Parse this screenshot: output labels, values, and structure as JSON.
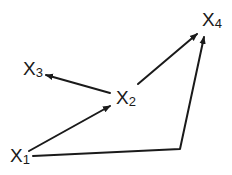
{
  "diagram": {
    "type": "directed-graph",
    "colors": {
      "edge": "#1a1a1a",
      "label": "#1a1a1a",
      "background": "#ffffff"
    },
    "nodes": [
      {
        "id": "x1",
        "base": "X",
        "sub": "1"
      },
      {
        "id": "x2",
        "base": "X",
        "sub": "2"
      },
      {
        "id": "x3",
        "base": "X",
        "sub": "3"
      },
      {
        "id": "x4",
        "base": "X",
        "sub": "4"
      }
    ],
    "edges": [
      {
        "from": "X1",
        "to": "X2"
      },
      {
        "from": "X2",
        "to": "X3"
      },
      {
        "from": "X2",
        "to": "X4"
      },
      {
        "from": "X1",
        "to": "X4",
        "note": "bent path via lower-right corner"
      }
    ]
  }
}
